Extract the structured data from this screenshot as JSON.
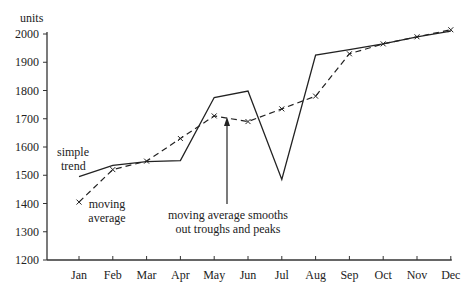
{
  "chart_data": {
    "type": "line",
    "title": "",
    "ylabel": "units",
    "xlabel": "",
    "categories": [
      "Jan",
      "Feb",
      "Mar",
      "Apr",
      "May",
      "Jun",
      "Jul",
      "Aug",
      "Sep",
      "Oct",
      "Nov",
      "Dec"
    ],
    "y_ticks": [
      1200,
      1300,
      1400,
      1500,
      1600,
      1700,
      1800,
      1900,
      2000
    ],
    "ylim": [
      1200,
      2000
    ],
    "grid": false,
    "series": [
      {
        "name": "simple trend",
        "style": "solid",
        "values": [
          1495,
          1535,
          1548,
          1552,
          1775,
          1798,
          1485,
          1925,
          1945,
          1965,
          1990,
          2010
        ]
      },
      {
        "name": "moving average",
        "style": "dashed-with-x-markers",
        "values": [
          1405,
          1520,
          1550,
          1630,
          1710,
          1690,
          1735,
          1780,
          1930,
          1965,
          1990,
          2015
        ]
      }
    ],
    "annotations": [
      {
        "text": [
          "simple",
          "trend"
        ],
        "target": "simple trend"
      },
      {
        "text": [
          "moving",
          "average"
        ],
        "target": "moving average"
      },
      {
        "text": [
          "moving average smooths",
          "out troughs and peaks"
        ],
        "arrow_to": "Jun"
      }
    ]
  }
}
